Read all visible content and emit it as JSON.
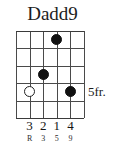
{
  "chord": {
    "name": "Dadd9",
    "position_label": "5fr.",
    "strings_count": 6,
    "frets_count": 5,
    "dots": [
      {
        "string": 4,
        "fret": 1,
        "type": "filled"
      },
      {
        "string": 3,
        "fret": 3,
        "type": "filled"
      },
      {
        "string": 2,
        "fret": 4,
        "type": "open"
      },
      {
        "string": 5,
        "fret": 4,
        "type": "filled"
      }
    ],
    "fingers": [
      {
        "string": 2,
        "label": "3"
      },
      {
        "string": 3,
        "label": "2"
      },
      {
        "string": 4,
        "label": "1"
      },
      {
        "string": 5,
        "label": "4"
      }
    ],
    "intervals": [
      {
        "string": 2,
        "label": "R"
      },
      {
        "string": 3,
        "label": "3"
      },
      {
        "string": 4,
        "label": "5"
      },
      {
        "string": 5,
        "label": "9"
      }
    ],
    "colors": {
      "ink": "#1c1c1c",
      "grid": "#4a4a4a",
      "dot_fill": "#111111",
      "background": "#ffffff"
    }
  }
}
